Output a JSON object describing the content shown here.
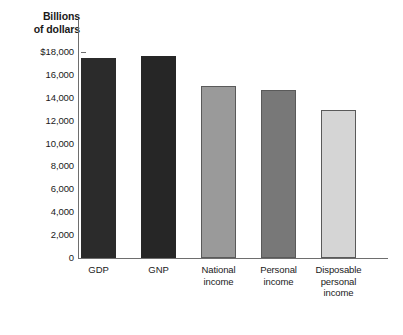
{
  "chart_data": {
    "type": "bar",
    "title": "Billions of dollars",
    "title_lines": [
      "Billions",
      "of dollars"
    ],
    "xlabel": "",
    "ylabel": "Billions of dollars",
    "ylim": [
      0,
      18000
    ],
    "grid": false,
    "legend": "none",
    "categories": [
      "GDP",
      "GNP",
      "National income",
      "Personal income",
      "Disposable personal income"
    ],
    "category_lines": [
      [
        "GDP"
      ],
      [
        "GNP"
      ],
      [
        "National",
        "income"
      ],
      [
        "Personal",
        "income"
      ],
      [
        "Disposable",
        "personal",
        "income"
      ]
    ],
    "values": [
      17450,
      17650,
      15050,
      14700,
      12950
    ],
    "bar_colors": [
      "#2b2b2b",
      "#262626",
      "#9a9a9a",
      "#787878",
      "#d5d5d5"
    ],
    "y_ticks": [
      {
        "value": 18000,
        "label": "$18,000"
      },
      {
        "value": 16000,
        "label": "16,000"
      },
      {
        "value": 14000,
        "label": "14,000"
      },
      {
        "value": 12000,
        "label": "12,000"
      },
      {
        "value": 10000,
        "label": "10,000"
      },
      {
        "value": 8000,
        "label": "8,000"
      },
      {
        "value": 6000,
        "label": "6,000"
      },
      {
        "value": 4000,
        "label": "4,000"
      },
      {
        "value": 2000,
        "label": "2,000"
      },
      {
        "value": 0,
        "label": "0"
      }
    ],
    "axis_color": "#6e6e6e",
    "text_color": "#1a1a1a"
  },
  "geometry": {
    "plot_top_px": 52,
    "plot_bottom_px": 258,
    "first_bar_left_px": 81,
    "bar_width_px": 35,
    "bar_pitch_px": 60
  }
}
